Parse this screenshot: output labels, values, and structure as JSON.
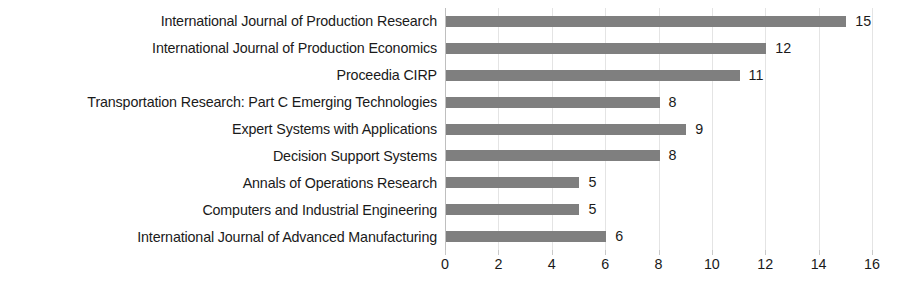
{
  "chart_data": {
    "type": "bar",
    "orientation": "horizontal",
    "title": "",
    "subtitle": "",
    "xlabel": "",
    "ylabel": "",
    "categories": [
      "International Journal of Production Research",
      "International Journal of Production Economics",
      "Proceedia CIRP",
      "Transportation Research: Part C Emerging Technologies",
      "Expert Systems with Applications",
      "Decision Support Systems",
      "Annals of Operations Research",
      "Computers and Industrial Engineering",
      "International Journal of Advanced Manufacturing"
    ],
    "values": [
      15,
      12,
      11,
      8,
      9,
      8,
      5,
      5,
      6
    ],
    "data_labels": [
      "15",
      "12",
      "11",
      "8",
      "9",
      "8",
      "5",
      "5",
      "6"
    ],
    "xlim": [
      0,
      16
    ],
    "x_ticks": [
      0,
      2,
      4,
      6,
      8,
      10,
      12,
      14,
      16
    ],
    "x_tick_labels": [
      "0",
      "2",
      "4",
      "6",
      "8",
      "10",
      "12",
      "14",
      "16"
    ],
    "grid": "vertical",
    "legend": "none",
    "bar_color": "#7f7f7f",
    "gridline_color": "#e4e4e4",
    "axis_line_color": "#bfbfbf",
    "text_color": "#1a1a1a",
    "background_color": "#ffffff"
  }
}
